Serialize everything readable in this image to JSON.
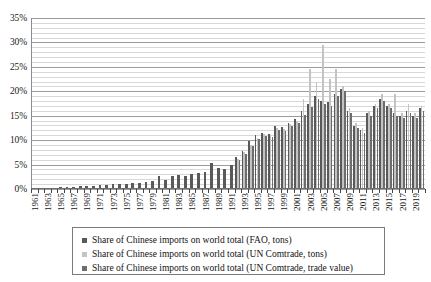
{
  "chart_data": {
    "type": "bar",
    "title": "",
    "subtitle": "",
    "xlabel": "",
    "ylabel": "",
    "ylim": [
      0,
      35
    ],
    "ytick_labels": [
      "0%",
      "5%",
      "10%",
      "15%",
      "20%",
      "25%",
      "30%",
      "35%"
    ],
    "ytick_values": [
      0,
      5,
      10,
      15,
      20,
      25,
      30,
      35
    ],
    "y_minor_step": 1,
    "grid": true,
    "legend_position": "bottom",
    "x_tick_step_years": 2,
    "categories": [
      "1961",
      "1962",
      "1963",
      "1964",
      "1965",
      "1966",
      "1967",
      "1968",
      "1969",
      "1970",
      "1971",
      "1972",
      "1973",
      "1974",
      "1975",
      "1976",
      "1977",
      "1978",
      "1979",
      "1980",
      "1981",
      "1982",
      "1983",
      "1984",
      "1985",
      "1986",
      "1987",
      "1988",
      "1989",
      "1990",
      "1991",
      "1992",
      "1993",
      "1994",
      "1995",
      "1996",
      "1997",
      "1998",
      "1999",
      "2000",
      "2001",
      "2002",
      "2003",
      "2004",
      "2005",
      "2006",
      "2007",
      "2008",
      "2009",
      "2010",
      "2011",
      "2012",
      "2013",
      "2014",
      "2015",
      "2016",
      "2017",
      "2018",
      "2019",
      "2020"
    ],
    "tick_labels": [
      "1961",
      "1963",
      "1965",
      "1967",
      "1969",
      "1971",
      "1973",
      "1975",
      "1977",
      "1979",
      "1981",
      "1983",
      "1985",
      "1987",
      "1989",
      "1991",
      "1993",
      "1995",
      "1997",
      "1999",
      "2001",
      "2003",
      "2005",
      "2007",
      "2009",
      "2011",
      "2013",
      "2015",
      "2017",
      "2019"
    ],
    "series": [
      {
        "name": "Share of Chinese imports on world total (FAO, tons)",
        "color": "#595959",
        "values": [
          0.2,
          0.2,
          0.3,
          0.3,
          0.4,
          0.4,
          0.5,
          0.6,
          0.6,
          0.7,
          0.8,
          0.9,
          1.0,
          1.0,
          1.1,
          1.2,
          1.3,
          1.4,
          1.6,
          2.6,
          1.8,
          2.7,
          2.8,
          2.6,
          3.0,
          3.2,
          3.4,
          5.3,
          4.4,
          4.0,
          4.9,
          6.5,
          7.8,
          9.8,
          11.0,
          11.5,
          11.3,
          13.0,
          12.6,
          13.6,
          14.3,
          16.0,
          17.5,
          19.0,
          18.0,
          17.8,
          19.5,
          20.5,
          16.0,
          13.0,
          12.0,
          15.5,
          17.0,
          18.5,
          17.0,
          15.5,
          15.0,
          16.0,
          15.0,
          16.5
        ]
      },
      {
        "name": "Share of Chinese imports on world total (UN Comtrade, tons)",
        "color": "#c3c3c3",
        "values": [
          null,
          null,
          null,
          null,
          null,
          null,
          null,
          null,
          null,
          null,
          null,
          null,
          null,
          null,
          null,
          null,
          null,
          null,
          null,
          null,
          null,
          null,
          null,
          null,
          null,
          null,
          null,
          null,
          null,
          null,
          null,
          6.2,
          7.5,
          9.0,
          10.5,
          11.2,
          11.0,
          12.5,
          12.3,
          13.3,
          14.0,
          18.5,
          24.5,
          22.0,
          29.5,
          22.5,
          24.5,
          21.0,
          16.5,
          13.5,
          12.5,
          16.0,
          17.5,
          19.5,
          17.5,
          19.5,
          15.5,
          17.5,
          15.5,
          17.0
        ]
      },
      {
        "name": "Share of Chinese imports on world total (UN Comtrade, trade value)",
        "color": "#6d6d6d",
        "values": [
          null,
          null,
          null,
          null,
          null,
          null,
          null,
          null,
          null,
          null,
          null,
          null,
          null,
          null,
          null,
          null,
          null,
          null,
          null,
          null,
          null,
          null,
          null,
          null,
          null,
          null,
          null,
          null,
          null,
          null,
          null,
          6.0,
          7.2,
          8.8,
          10.2,
          10.8,
          10.6,
          12.0,
          11.8,
          13.0,
          13.6,
          15.2,
          16.8,
          18.5,
          17.5,
          17.0,
          19.0,
          20.0,
          15.5,
          12.5,
          11.5,
          15.0,
          16.5,
          18.0,
          16.5,
          15.0,
          14.5,
          15.5,
          14.5,
          16.0
        ]
      }
    ]
  },
  "legend": {
    "items": [
      {
        "label": "Share of Chinese imports on world total (FAO, tons)",
        "color": "#595959"
      },
      {
        "label": "Share of Chinese imports on world total (UN Comtrade, tons)",
        "color": "#c3c3c3"
      },
      {
        "label": "Share of Chinese imports on world total (UN Comtrade, trade value)",
        "color": "#6d6d6d"
      }
    ]
  }
}
